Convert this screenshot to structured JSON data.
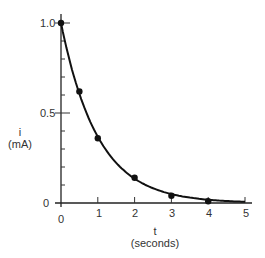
{
  "chart_data": {
    "type": "line",
    "title": "",
    "xlabel": "t",
    "xlabel_unit": "(seconds)",
    "ylabel": "i",
    "ylabel_unit": "(mA)",
    "x_ticks": [
      "0",
      "1",
      "2",
      "3",
      "4",
      "5"
    ],
    "y_ticks": [
      "0",
      "0.5",
      "1.0"
    ],
    "xlim": [
      0,
      5
    ],
    "ylim": [
      0,
      1.0
    ],
    "grid": false,
    "series": [
      {
        "name": "i(t)",
        "x": [
          0,
          0.5,
          1,
          2,
          3,
          4
        ],
        "values": [
          1.0,
          0.62,
          0.36,
          0.14,
          0.04,
          0.01
        ],
        "markers": true
      }
    ]
  }
}
